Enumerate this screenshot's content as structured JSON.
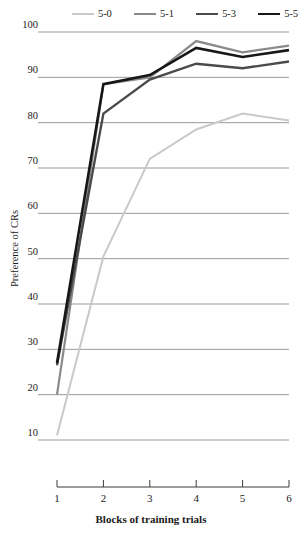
{
  "chart_data": {
    "type": "line",
    "title": "",
    "xlabel": "Blocks of training trials",
    "ylabel": "Preference of CRs",
    "categories": [
      "1",
      "2",
      "3",
      "4",
      "5",
      "6"
    ],
    "x": [
      1,
      2,
      3,
      4,
      5,
      6
    ],
    "xlim": [
      1,
      6
    ],
    "ylim": [
      10,
      100
    ],
    "yticks": [
      10,
      20,
      30,
      40,
      50,
      60,
      70,
      80,
      90,
      100
    ],
    "ytick_labels": [
      "10",
      "20",
      "30",
      "40",
      "50",
      "60",
      "70",
      "80",
      "90",
      "100"
    ],
    "grid": true,
    "grid_axis": "y",
    "legend_position": "top",
    "series": [
      {
        "name": "5-0",
        "color": "#c9c9c9",
        "width": 2.0,
        "values": [
          11,
          50.5,
          72,
          78.5,
          82,
          80.5
        ]
      },
      {
        "name": "5-1",
        "color": "#8a8a8a",
        "width": 2.2,
        "values": [
          20,
          88.5,
          90,
          98,
          95.5,
          97
        ]
      },
      {
        "name": "5-3",
        "color": "#4a4a4a",
        "width": 2.4,
        "values": [
          26.5,
          82,
          89.5,
          93,
          92,
          93.5
        ]
      },
      {
        "name": "5-5",
        "color": "#171717",
        "width": 2.6,
        "values": [
          27,
          88.5,
          90.5,
          96.5,
          94.5,
          96
        ]
      }
    ]
  },
  "axes": {
    "y_title": "Preference of CRs",
    "x_title": "Blocks of training trials"
  },
  "legend": {
    "entries": [
      {
        "label": "5-0"
      },
      {
        "label": "5-1"
      },
      {
        "label": "5-3"
      },
      {
        "label": "5-5"
      }
    ]
  },
  "colors": {
    "grid": "#8e8e8e",
    "axis": "#3a3a3a",
    "background": "#ffffff",
    "series_5_0": "#c9c9c9",
    "series_5_1": "#8a8a8a",
    "series_5_3": "#4a4a4a",
    "series_5_5": "#171717"
  }
}
